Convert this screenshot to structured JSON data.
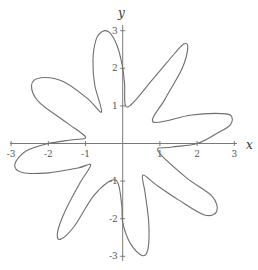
{
  "chart_data": {
    "type": "line",
    "title": "",
    "xlabel": "x",
    "ylabel": "y",
    "xlim": [
      -3,
      3
    ],
    "ylim": [
      -3,
      3
    ],
    "grid": false,
    "legend": null,
    "x_ticks": [
      -3,
      -2,
      -1,
      1,
      2,
      3
    ],
    "y_ticks": [
      -3,
      -2,
      -1,
      1,
      2,
      3
    ],
    "x_tick_labels": [
      "-3",
      "-2",
      "-1",
      "1",
      "2",
      "3"
    ],
    "y_tick_labels": [
      "-3",
      "-2",
      "-1",
      "1",
      "2",
      "3"
    ],
    "series": [
      {
        "name": "curve",
        "closed": true,
        "points": [
          [
            0.13,
            0.97
          ],
          [
            0.05,
            1.6
          ],
          [
            -0.01,
            2.07
          ],
          [
            -0.15,
            2.6
          ],
          [
            -0.35,
            2.95
          ],
          [
            -0.55,
            2.98
          ],
          [
            -0.72,
            2.75
          ],
          [
            -0.8,
            2.2
          ],
          [
            -0.75,
            1.55
          ],
          [
            -0.57,
            0.84
          ],
          [
            -0.95,
            1.2
          ],
          [
            -1.6,
            1.65
          ],
          [
            -2.2,
            1.75
          ],
          [
            -2.45,
            1.55
          ],
          [
            -2.25,
            1.1
          ],
          [
            -1.5,
            0.55
          ],
          [
            -1.0,
            0.17
          ],
          [
            -1.35,
            0.1
          ],
          [
            -2.0,
            0.0
          ],
          [
            -2.6,
            -0.2
          ],
          [
            -2.9,
            -0.55
          ],
          [
            -2.7,
            -0.77
          ],
          [
            -2.0,
            -0.78
          ],
          [
            -1.2,
            -0.65
          ],
          [
            -0.86,
            -0.57
          ],
          [
            -1.15,
            -1.05
          ],
          [
            -1.55,
            -1.8
          ],
          [
            -1.75,
            -2.35
          ],
          [
            -1.68,
            -2.55
          ],
          [
            -1.3,
            -2.2
          ],
          [
            -0.75,
            -1.35
          ],
          [
            -0.19,
            -0.97
          ],
          [
            -0.03,
            -1.6
          ],
          [
            0.0,
            -2.1
          ],
          [
            0.2,
            -2.65
          ],
          [
            0.52,
            -2.98
          ],
          [
            0.68,
            -2.8
          ],
          [
            0.7,
            -2.1
          ],
          [
            0.6,
            -1.3
          ],
          [
            0.54,
            -0.84
          ],
          [
            0.9,
            -1.1
          ],
          [
            1.5,
            -1.5
          ],
          [
            2.2,
            -1.9
          ],
          [
            2.53,
            -1.8
          ],
          [
            2.4,
            -1.4
          ],
          [
            1.7,
            -0.9
          ],
          [
            0.95,
            -0.2
          ],
          [
            1.3,
            -0.1
          ],
          [
            2.0,
            0.0
          ],
          [
            2.55,
            0.28
          ],
          [
            2.9,
            0.5
          ],
          [
            2.9,
            0.75
          ],
          [
            2.5,
            0.8
          ],
          [
            1.8,
            0.75
          ],
          [
            0.82,
            0.57
          ],
          [
            1.15,
            1.2
          ],
          [
            1.6,
            2.0
          ],
          [
            1.75,
            2.55
          ],
          [
            1.65,
            2.65
          ],
          [
            1.4,
            2.4
          ],
          [
            0.8,
            1.7
          ],
          [
            0.13,
            0.97
          ]
        ]
      }
    ]
  },
  "labels": {
    "x_axis": "x",
    "y_axis": "y"
  }
}
